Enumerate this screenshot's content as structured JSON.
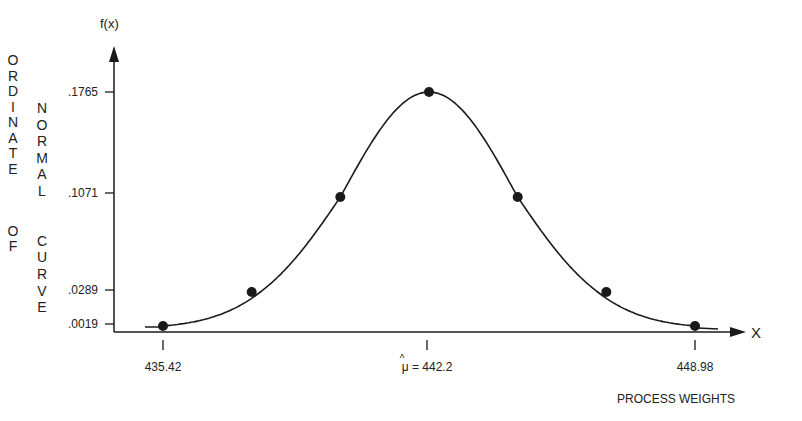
{
  "chart_data": {
    "type": "line",
    "title": "",
    "xlabel": "PROCESS WEIGHTS",
    "ylabel": "ORDINATE OF NORMAL CURVE",
    "y_axis_symbol": "f(x)",
    "x_axis_symbol": "X",
    "x_ticks": [
      {
        "value": 435.42,
        "label": "435.42"
      },
      {
        "value": 442.2,
        "label": "μ̂ = 442.2",
        "mean_symbol": "μ",
        "hat": "^",
        "equals_text": "= 442.2"
      },
      {
        "value": 448.98,
        "label": "448.98"
      }
    ],
    "y_ticks": [
      ".1765",
      ".1071",
      ".0289",
      ".0019"
    ],
    "mean": 442.2,
    "sigma": 2.26,
    "series": [
      {
        "name": "Normal curve",
        "points": [
          {
            "x": 435.42,
            "y": 0.0019
          },
          {
            "x": 437.68,
            "y": 0.0289
          },
          {
            "x": 439.94,
            "y": 0.1071
          },
          {
            "x": 442.2,
            "y": 0.1765
          },
          {
            "x": 444.46,
            "y": 0.1071
          },
          {
            "x": 446.72,
            "y": 0.0289
          },
          {
            "x": 448.98,
            "y": 0.0019
          }
        ]
      }
    ],
    "grid": false,
    "legend": "none"
  },
  "ylabel_col1": [
    "O",
    "R",
    "D",
    "I",
    "N",
    "A",
    "T",
    "E",
    "",
    "",
    "",
    "O",
    "F"
  ],
  "ylabel_col2": [
    "N",
    "O",
    "R",
    "M",
    "A",
    "L",
    "",
    "",
    "C",
    "U",
    "R",
    "V",
    "E"
  ],
  "colors": {
    "ink": "#1a1a1a",
    "background": "#ffffff"
  }
}
